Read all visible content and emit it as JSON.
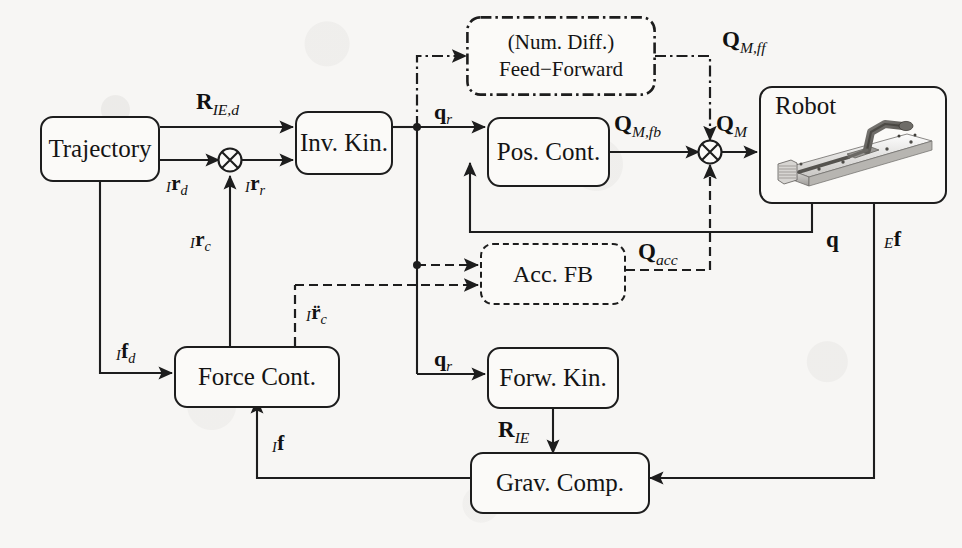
{
  "diagram": {
    "background_color": "#f7f6f4",
    "line_color": "#1d1d1d"
  },
  "blocks": [
    {
      "id": "trajectory",
      "label": "Trajectory",
      "style": "solid"
    },
    {
      "id": "inv_kin",
      "label": "Inv. Kin.",
      "style": "solid"
    },
    {
      "id": "feed_forward",
      "label_line1": "(Num. Diff.)",
      "label_line2": "Feed−Forward",
      "style": "dash-dot"
    },
    {
      "id": "pos_cont",
      "label": "Pos. Cont.",
      "style": "solid"
    },
    {
      "id": "robot",
      "label": "Robot",
      "style": "solid",
      "has_photo": true
    },
    {
      "id": "acc_fb",
      "label": "Acc. FB",
      "style": "dashed"
    },
    {
      "id": "force_cont",
      "label": "Force Cont.",
      "style": "solid"
    },
    {
      "id": "forw_kin",
      "label": "Forw. Kin.",
      "style": "solid"
    },
    {
      "id": "grav_comp",
      "label": "Grav. Comp.",
      "style": "solid"
    }
  ],
  "signals": {
    "R_IE_d": {
      "base": "R",
      "sub": "IE,d",
      "pre": ""
    },
    "r_d": {
      "base": "r",
      "sub": "d",
      "pre": "I"
    },
    "r_r": {
      "base": "r",
      "sub": "r",
      "pre": "I"
    },
    "r_c": {
      "base": "r",
      "sub": "c",
      "pre": "I"
    },
    "q_r_top": {
      "base": "q",
      "sub": "r",
      "pre": ""
    },
    "q_r_bot": {
      "base": "q",
      "sub": "r",
      "pre": ""
    },
    "Q_M_ff": {
      "base": "Q",
      "sub": "M,ff",
      "pre": ""
    },
    "Q_M_fb": {
      "base": "Q",
      "sub": "M,fb",
      "pre": ""
    },
    "Q_M": {
      "base": "Q",
      "sub": "M",
      "pre": ""
    },
    "Q_acc": {
      "base": "Q",
      "sub": "acc",
      "pre": ""
    },
    "q": {
      "base": "q",
      "sub": "",
      "pre": ""
    },
    "E_f": {
      "base": "f",
      "sub": "",
      "pre": "E"
    },
    "f_d": {
      "base": "f",
      "sub": "d",
      "pre": "I"
    },
    "I_f": {
      "base": "f",
      "sub": "",
      "pre": "I"
    },
    "rddot_c": {
      "base": "r̈",
      "sub": "c",
      "pre": "I"
    },
    "R_IE": {
      "base": "R",
      "sub": "IE",
      "pre": ""
    }
  },
  "junctions": [
    {
      "id": "sum-left",
      "type": "circle-plus",
      "inputs": [
        "r_d",
        "r_c"
      ],
      "output": "r_r"
    },
    {
      "id": "sum-right",
      "type": "circle-plus",
      "inputs": [
        "Q_M_fb",
        "Q_M_ff",
        "Q_acc"
      ],
      "output": "Q_M"
    }
  ],
  "line_styles": {
    "solid": "solid",
    "dashed": "dashed",
    "dash_dot": "dash-dot"
  }
}
